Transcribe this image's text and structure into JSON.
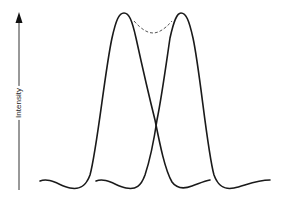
{
  "figure": {
    "type": "diagram",
    "y_axis": {
      "label": "Intensity",
      "arrow_direction": "up"
    },
    "curves": [
      {
        "name": "left-peak",
        "style": "solid",
        "peak_x": 124
      },
      {
        "name": "right-peak",
        "style": "solid",
        "peak_x": 181
      },
      {
        "name": "combined-dip",
        "style": "dashed"
      }
    ],
    "colors": {
      "line": "#1a1a1a",
      "dashed": "#555555",
      "axis": "#333333"
    }
  }
}
